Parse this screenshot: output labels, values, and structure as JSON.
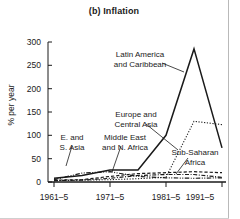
{
  "figure": {
    "title": "(b) Inflation",
    "ylabel": "% per year"
  },
  "axes": {
    "yticks": [
      "0",
      "50",
      "100",
      "150",
      "200",
      "250",
      "300"
    ],
    "xticks": [
      "1961–5",
      "1971–5",
      "1981–5",
      "1991–5"
    ]
  },
  "annotations": {
    "latin_america": {
      "line1": "Latin America",
      "line2": "and Caribbean"
    },
    "europe": {
      "line1": "Europe and",
      "line2": "Central Asia"
    },
    "east_south_asia": {
      "line1": "E. and",
      "line2": "S. Asia"
    },
    "middle_east": {
      "line1": "Middle East",
      "line2": "and N. Africa"
    },
    "sub_saharan": {
      "line1": "Sub-Saharan",
      "line2": "Africa"
    }
  },
  "chart_data": {
    "type": "line",
    "title": "(b) Inflation",
    "xlabel": "",
    "ylabel": "% per year",
    "ylim": [
      0,
      300
    ],
    "yticks": [
      0,
      50,
      100,
      150,
      200,
      250,
      300
    ],
    "grid": false,
    "legend": "annotations-on-plot",
    "categories": [
      "1961–5",
      "1966–70",
      "1971–5",
      "1976–80",
      "1981–5",
      "1986–90",
      "1991–5"
    ],
    "xtick_categories": [
      "1961–5",
      "1971–5",
      "1981–5",
      "1991–5"
    ],
    "series": [
      {
        "name": "Latin America and Caribbean",
        "style": "solid",
        "color": "#1a1a1a",
        "values": [
          8,
          14,
          26,
          26,
          100,
          285,
          73
        ]
      },
      {
        "name": "Europe and Central Asia",
        "style": "dotted",
        "color": "#1a1a1a",
        "values": [
          3,
          4,
          5,
          7,
          10,
          130,
          123
        ]
      },
      {
        "name": "Sub-Saharan Africa",
        "style": "dashed",
        "color": "#1a1a1a",
        "values": [
          4,
          5,
          12,
          18,
          20,
          22,
          20
        ]
      },
      {
        "name": "Middle East and N. Africa",
        "style": "dash-dot",
        "color": "#1a1a1a",
        "values": [
          3,
          4,
          8,
          14,
          16,
          16,
          10
        ]
      },
      {
        "name": "E. and S. Asia",
        "style": "dash-dot-dot",
        "color": "#1a1a1a",
        "values": [
          5,
          19,
          22,
          12,
          9,
          8,
          9
        ]
      }
    ]
  }
}
